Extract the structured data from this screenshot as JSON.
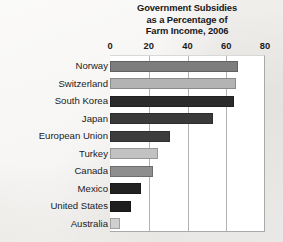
{
  "chart_data": {
    "type": "bar",
    "orientation": "horizontal",
    "title": "Government Subsidies as a Percentage of Farm Income, 2006",
    "title_lines": [
      "Government Subsidies",
      "as a Percentage of",
      "Farm Income, 2006"
    ],
    "xlabel": "",
    "ylabel": "",
    "xlim": [
      0,
      80
    ],
    "ylim": null,
    "xticks": [
      0,
      20,
      40,
      60,
      80
    ],
    "xtick_labels": [
      "0",
      "20",
      "40",
      "60",
      "80"
    ],
    "grid": true,
    "grid_axis": "x",
    "legend": false,
    "legend_position": "none",
    "categories": [
      "Norway",
      "Switzerland",
      "South Korea",
      "Japan",
      "European Union",
      "Turkey",
      "Canada",
      "Mexico",
      "United States",
      "Australia"
    ],
    "values": [
      66,
      65,
      64,
      53,
      31,
      25,
      22,
      16,
      11,
      5
    ],
    "bar_colors": [
      "#7d7d7d",
      "#b3b3b3",
      "#2b2b2b",
      "#3a3a3a",
      "#3d3d3d",
      "#c2c2c2",
      "#8e8e8e",
      "#222222",
      "#1e1e1e",
      "#cfcfcf"
    ],
    "bars": [
      {
        "label": "Norway",
        "value": 66,
        "color": "#7d7d7d"
      },
      {
        "label": "Switzerland",
        "value": 65,
        "color": "#b3b3b3"
      },
      {
        "label": "South Korea",
        "value": 64,
        "color": "#2b2b2b"
      },
      {
        "label": "Japan",
        "value": 53,
        "color": "#3a3a3a"
      },
      {
        "label": "European Union",
        "value": 31,
        "color": "#3d3d3d"
      },
      {
        "label": "Turkey",
        "value": 25,
        "color": "#c2c2c2"
      },
      {
        "label": "Canada",
        "value": 22,
        "color": "#8e8e8e"
      },
      {
        "label": "Mexico",
        "value": 16,
        "color": "#222222"
      },
      {
        "label": "United States",
        "value": 11,
        "color": "#1e1e1e"
      },
      {
        "label": "Australia",
        "value": 5,
        "color": "#cfcfcf"
      }
    ],
    "plot_background": "#ffffff",
    "figure_background": "#f0efed",
    "gridline_color": "#b3b3b3"
  }
}
